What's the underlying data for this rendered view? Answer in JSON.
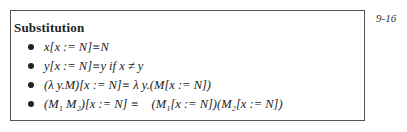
{
  "page_number": "9-16",
  "title": "Substitution",
  "rules": [
    {
      "formula": "x[x := N]≡N"
    },
    {
      "formula": "y[x := N]≡y if x ≠ y"
    },
    {
      "formula": "(λ y.M)[x := N]≡ λ y.(M[x := N])"
    },
    {
      "formula": "(M₁ M₂)[x := N] ≡    (M₁[x := N])(M₂[x := N])"
    }
  ]
}
